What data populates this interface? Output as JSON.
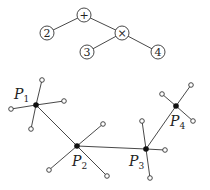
{
  "expression_tree": {
    "nodes": [
      {
        "id": "plus",
        "label": "+",
        "x": 84,
        "y": 15
      },
      {
        "id": "two",
        "label": "2",
        "x": 47,
        "y": 33
      },
      {
        "id": "times",
        "label": "×",
        "x": 122,
        "y": 33
      },
      {
        "id": "three",
        "label": "3",
        "x": 87,
        "y": 52
      },
      {
        "id": "four",
        "label": "4",
        "x": 158,
        "y": 52
      }
    ],
    "edges": [
      [
        "plus",
        "two"
      ],
      [
        "plus",
        "times"
      ],
      [
        "times",
        "three"
      ],
      [
        "times",
        "four"
      ]
    ]
  },
  "hub_graph": {
    "hubs": [
      {
        "id": "P1",
        "letter": "P",
        "sub": "1",
        "x": 36,
        "y": 105,
        "label_x": 14,
        "label_y": 99,
        "leaves": [
          [
            42,
            80
          ],
          [
            64,
            101
          ],
          [
            11,
            109
          ],
          [
            31,
            129
          ]
        ]
      },
      {
        "id": "P2",
        "letter": "P",
        "sub": "2",
        "x": 77,
        "y": 146,
        "label_x": 72,
        "label_y": 166,
        "leaves": [
          [
            103,
            124
          ],
          [
            49,
            170
          ],
          [
            107,
            176
          ]
        ]
      },
      {
        "id": "P3",
        "letter": "P",
        "sub": "3",
        "x": 146,
        "y": 149,
        "label_x": 129,
        "label_y": 166,
        "leaves": [
          [
            142,
            121
          ],
          [
            165,
            150
          ],
          [
            150,
            178
          ]
        ]
      },
      {
        "id": "P4",
        "letter": "P",
        "sub": "4",
        "x": 176,
        "y": 106,
        "label_x": 170,
        "label_y": 126,
        "leaves": [
          [
            191,
            85
          ],
          [
            162,
            94
          ],
          [
            193,
            121
          ]
        ]
      }
    ],
    "hub_edges": [
      [
        "P1",
        "P2"
      ],
      [
        "P2",
        "P3"
      ],
      [
        "P3",
        "P4"
      ]
    ]
  }
}
